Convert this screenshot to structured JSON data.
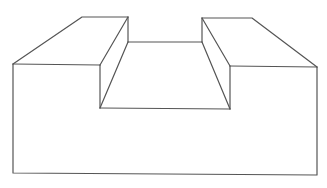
{
  "diagram": {
    "type": "3d-line-drawing",
    "stroke_color": "#555555",
    "background": "#ffffff",
    "parts": [
      {
        "name": "left-block",
        "description": "raised left step"
      },
      {
        "name": "channel",
        "description": "recessed center slot"
      },
      {
        "name": "right-block",
        "description": "raised right step"
      },
      {
        "name": "base-front-face",
        "description": "large front face of the base"
      }
    ]
  }
}
